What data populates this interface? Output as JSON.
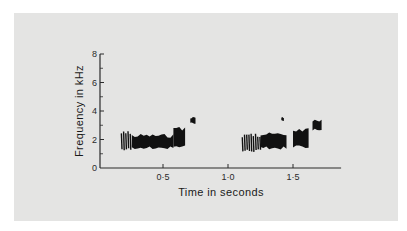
{
  "chart_data": {
    "type": "heatmap",
    "subtype": "spectrogram",
    "title": "",
    "xlabel": "Time in seconds",
    "ylabel": "Frequency in kHz",
    "xlim": [
      0,
      1.87
    ],
    "ylim": [
      0,
      8
    ],
    "x_ticks": [
      0.5,
      1.0,
      1.5
    ],
    "x_tick_labels": [
      "0·5",
      "1·0",
      "1·5"
    ],
    "y_ticks": [
      0,
      2,
      4,
      6,
      8
    ],
    "y_tick_labels": [
      "0",
      "2",
      "4",
      "6",
      "8"
    ],
    "y_minor_ticks": [
      1,
      3,
      5,
      7
    ],
    "grid": false,
    "legend": null,
    "segments": [
      {
        "name": "call-1-striated-onset",
        "t_start": 0.18,
        "t_end": 0.26,
        "f_low": 1.2,
        "f_high": 2.6,
        "style": "striations"
      },
      {
        "name": "call-1-main-band",
        "t_start": 0.26,
        "t_end": 0.58,
        "f_low": 1.3,
        "f_high": 2.4,
        "style": "dense"
      },
      {
        "name": "call-1-rising-tail",
        "t_start": 0.58,
        "t_end": 0.67,
        "f_low": 1.4,
        "f_high": 2.9,
        "style": "dense"
      },
      {
        "name": "call-1-high-note",
        "t_start": 0.71,
        "t_end": 0.75,
        "f_low": 3.1,
        "f_high": 3.6,
        "style": "dense"
      },
      {
        "name": "call-2-striated-onset",
        "t_start": 1.11,
        "t_end": 1.25,
        "f_low": 1.1,
        "f_high": 2.5,
        "style": "striations"
      },
      {
        "name": "call-2-main-band",
        "t_start": 1.25,
        "t_end": 1.45,
        "f_low": 1.3,
        "f_high": 2.5,
        "style": "dense"
      },
      {
        "name": "call-2-dot",
        "t_start": 1.41,
        "t_end": 1.43,
        "f_low": 3.3,
        "f_high": 3.6,
        "style": "dense"
      },
      {
        "name": "call-2-rising-tail",
        "t_start": 1.5,
        "t_end": 1.62,
        "f_low": 1.4,
        "f_high": 2.8,
        "style": "dense"
      },
      {
        "name": "call-2-high-note",
        "t_start": 1.65,
        "t_end": 1.72,
        "f_low": 2.6,
        "f_high": 3.4,
        "style": "dense"
      }
    ]
  },
  "colors": {
    "panel": "#e4e4e3",
    "ink": "#111111",
    "axis": "#2a2a2a"
  }
}
